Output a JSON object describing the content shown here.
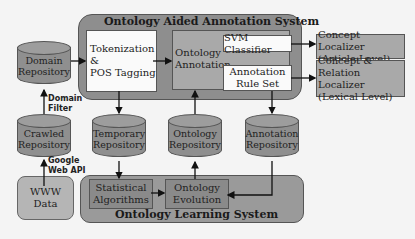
{
  "diagram": {
    "top_system": {
      "title": "Ontology Aided Annotation System"
    },
    "bottom_system": {
      "title": "Ontology Learning System"
    },
    "tokenization": {
      "line1": "Tokenization &",
      "line2": "POS Tagging"
    },
    "ontology_annotation": {
      "line1": "Ontology",
      "line2": "Annotation"
    },
    "svm_classifier": {
      "label": "SVM Classifier"
    },
    "annotation_rule_set": {
      "line1": "Annotation",
      "line2": "Rule Set"
    },
    "concept_localizer": {
      "line1": "Concept Localizer",
      "line2": "(Article Level)"
    },
    "concept_relation_localizer": {
      "line1": "Concept & Relation",
      "line2": "Localizer",
      "line3": "(Lexical Level)"
    },
    "domain_repository": {
      "line1": "Domain",
      "line2": "Repository"
    },
    "crawled_repository": {
      "line1": "Crawled",
      "line2": "Repository"
    },
    "temporary_repository": {
      "line1": "Temporary",
      "line2": "Repository"
    },
    "ontology_repository": {
      "line1": "Ontology",
      "line2": "Repository"
    },
    "annotation_repository": {
      "line1": "Annotation",
      "line2": "Repository"
    },
    "www_data": {
      "line1": "WWW",
      "line2": "Data"
    },
    "statistical_algorithms": {
      "line1": "Statistical",
      "line2": "Algorithms"
    },
    "ontology_evolution": {
      "line1": "Ontology",
      "line2": "Evolution"
    },
    "edge_labels": {
      "domain_filter": {
        "line1": "Domain",
        "line2": "Filter"
      },
      "google_web_api": {
        "line1": "Google",
        "line2": "Web API"
      }
    }
  }
}
